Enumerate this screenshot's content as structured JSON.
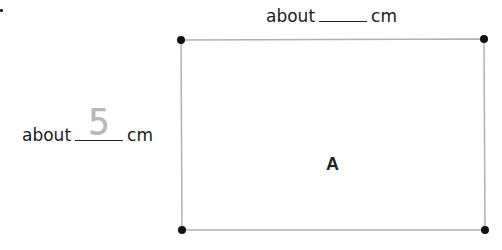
{
  "item_marker": ".",
  "shape": {
    "label": "A",
    "type": "rectangle",
    "corners": [
      [
        181,
        40
      ],
      [
        484,
        39
      ],
      [
        485,
        230
      ],
      [
        182,
        230
      ]
    ],
    "stroke_color": "#b0b0b0",
    "dot_color": "#111111"
  },
  "top_measure": {
    "prefix": "about",
    "answer": "",
    "unit": "cm"
  },
  "left_measure": {
    "prefix": "about",
    "answer": "5",
    "unit": "cm"
  }
}
